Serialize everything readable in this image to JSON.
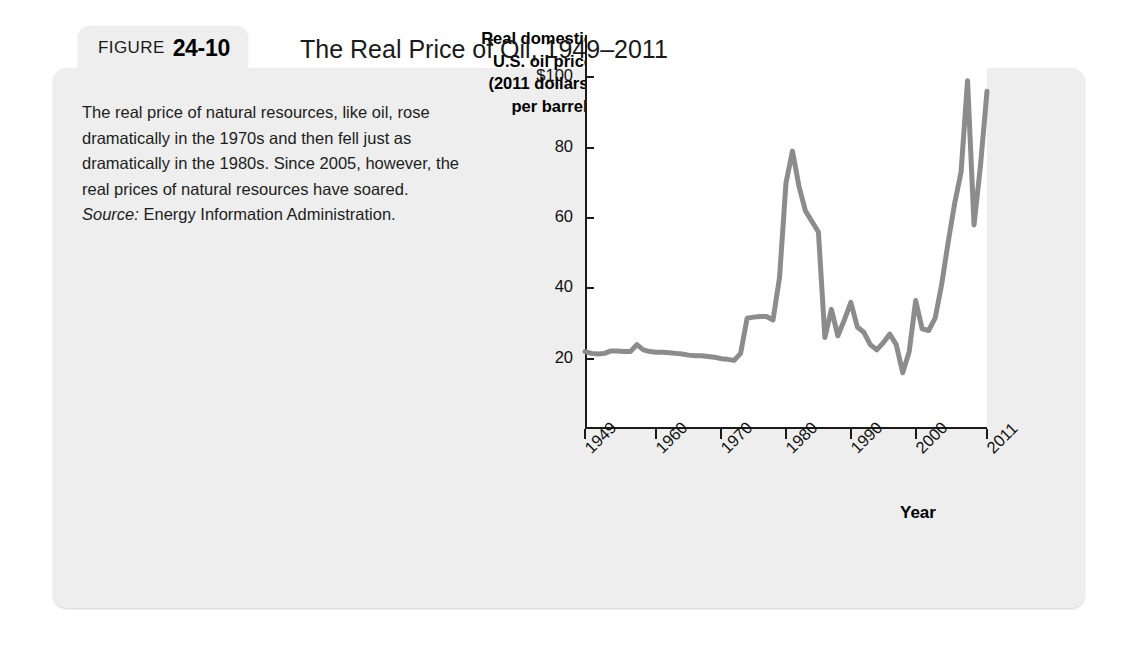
{
  "figure": {
    "label_word": "FIGURE",
    "number": "24-10",
    "title": "The Real Price of Oil, 1949–2011"
  },
  "caption": {
    "body": "The real price of natural resources, like oil, rose dramatically in the 1970s and then fell just as dramatically in the 1980s. Since 2005, however, the real prices of natural resources have soared.",
    "source_label": "Source:",
    "source_text": " Energy Information Administration."
  },
  "chart_data": {
    "type": "line",
    "title": "The Real Price of Oil, 1949–2011",
    "xlabel": "Year",
    "ylabel": "Real domestic U.S. oil price (2011 dollars, per barrel)",
    "ylabel_lines": [
      "Real domestic",
      "U.S. oil price",
      "(2011 dollars,",
      "per barrel)"
    ],
    "xlim": [
      1949,
      2011
    ],
    "ylim": [
      0,
      112
    ],
    "grid": false,
    "legend": "none",
    "line_color": "#8c8c8c",
    "axis_color": "#1a1a1a",
    "plot_background": "#ffffff",
    "ytick_labels": [
      "$100",
      "80",
      "60",
      "40",
      "20"
    ],
    "ytick_values": [
      100,
      80,
      60,
      40,
      20
    ],
    "xtick_labels": [
      "1949",
      "1960",
      "1970",
      "1980",
      "1990",
      "2000",
      "2011"
    ],
    "xtick_values": [
      1949,
      1960,
      1970,
      1980,
      1990,
      2000,
      2011
    ],
    "x": [
      1949,
      1950,
      1951,
      1952,
      1953,
      1954,
      1955,
      1956,
      1957,
      1958,
      1959,
      1960,
      1961,
      1962,
      1963,
      1964,
      1965,
      1966,
      1967,
      1968,
      1969,
      1970,
      1971,
      1972,
      1973,
      1974,
      1975,
      1976,
      1977,
      1978,
      1979,
      1980,
      1981,
      1982,
      1983,
      1984,
      1985,
      1986,
      1987,
      1988,
      1989,
      1990,
      1991,
      1992,
      1993,
      1994,
      1995,
      1996,
      1997,
      1998,
      1999,
      2000,
      2001,
      2002,
      2003,
      2004,
      2005,
      2006,
      2007,
      2008,
      2009,
      2010,
      2011
    ],
    "values": [
      22.0,
      21.5,
      21.3,
      21.5,
      22.2,
      22.2,
      22.0,
      22.0,
      24.0,
      22.5,
      22.0,
      21.8,
      21.8,
      21.7,
      21.5,
      21.3,
      21.0,
      20.8,
      20.8,
      20.6,
      20.4,
      20.0,
      19.8,
      19.5,
      21.5,
      31.5,
      31.8,
      32.0,
      32.0,
      31.0,
      43.0,
      70.0,
      79.0,
      69.0,
      62.0,
      59.0,
      56.0,
      26.0,
      34.0,
      26.5,
      31.0,
      36.0,
      29.0,
      27.5,
      24.0,
      22.5,
      24.5,
      27.0,
      24.0,
      16.0,
      22.0,
      36.5,
      28.5,
      28.0,
      31.5,
      41.0,
      53.0,
      64.0,
      73.0,
      99.0,
      58.0,
      75.0,
      96.0
    ]
  }
}
